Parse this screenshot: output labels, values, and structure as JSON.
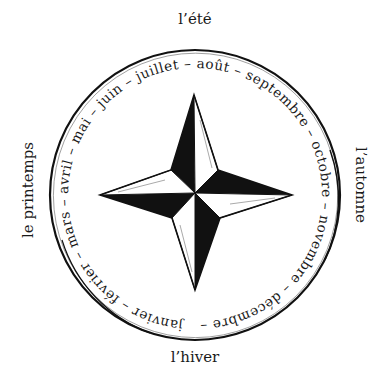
{
  "seasons": {
    "top": "l’été",
    "right": "l’automne",
    "bottom": "l’hiver",
    "left": "le printemps"
  },
  "ring": {
    "months": [
      "janvier",
      "février",
      "mars",
      "avril",
      "mai",
      "juin",
      "juillet",
      "août",
      "septembre",
      "octobre",
      "novembre",
      "décembre"
    ],
    "separator": " – ",
    "text": "janvier – février – mars – avril – mai – juin – juillet – août – septembre – octobre – novembre – décembre – "
  },
  "graphic": {
    "center_icon": "four-point-compass-star",
    "ink_color": "#111111",
    "paper_color": "#ffffff"
  }
}
